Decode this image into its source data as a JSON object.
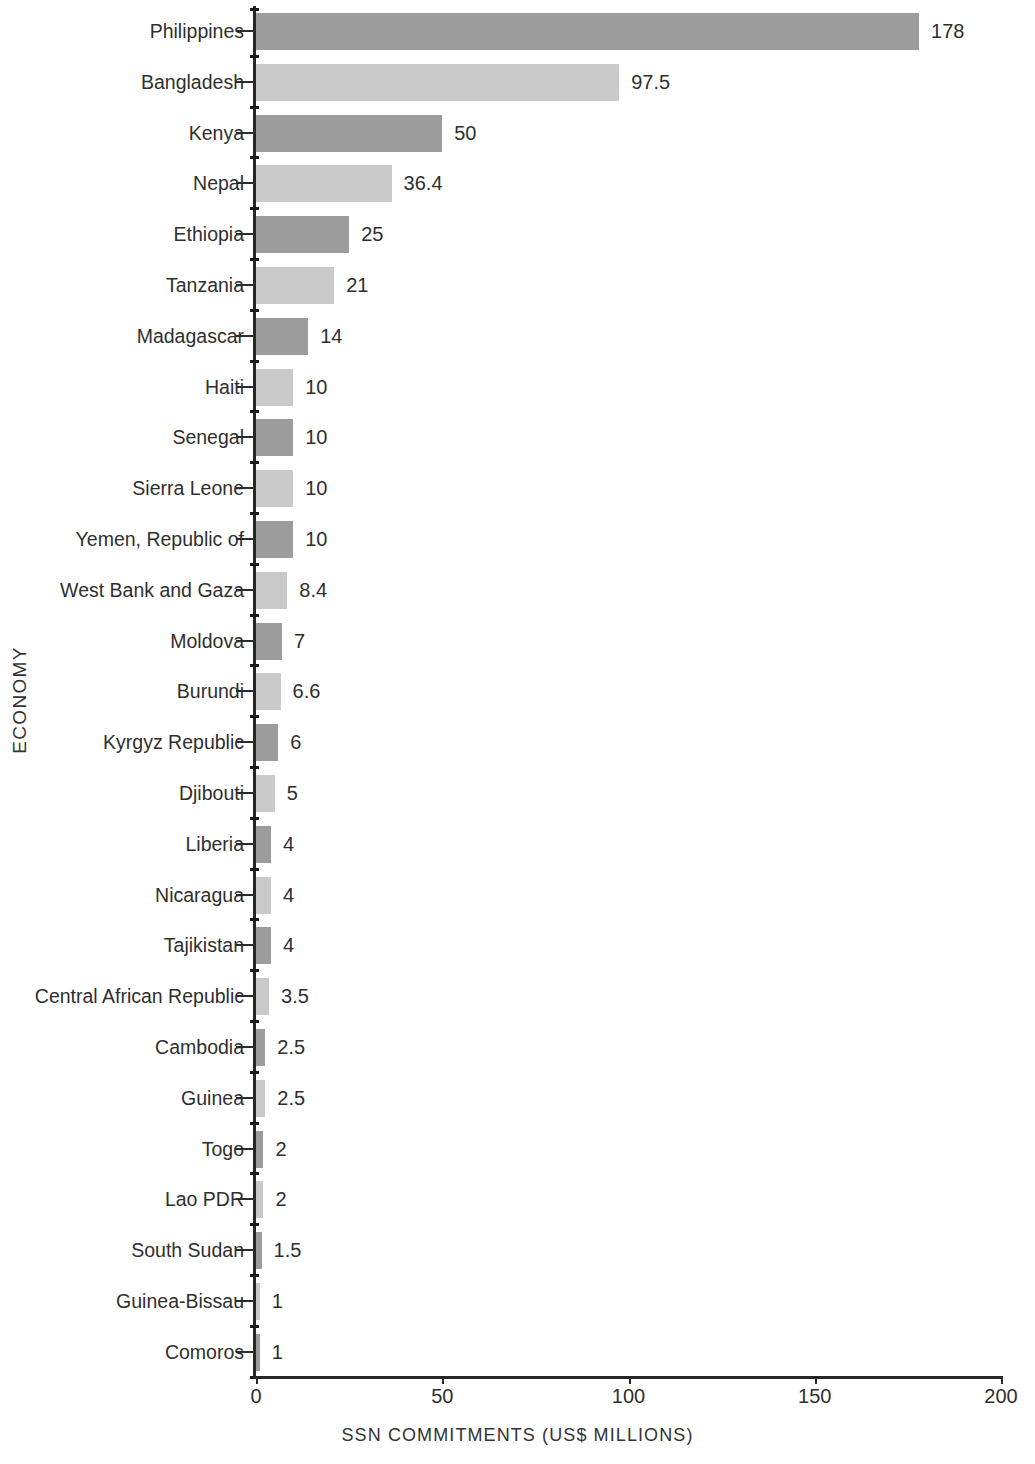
{
  "chart_data": {
    "type": "bar",
    "orientation": "horizontal",
    "title": "",
    "xlabel": "SSN COMMITMENTS (US$ MILLIONS)",
    "ylabel": "ECONOMY",
    "xlim": [
      0,
      200
    ],
    "xticks": [
      0,
      50,
      100,
      150,
      200
    ],
    "xtick_labels": [
      "0",
      "50",
      "100",
      "150",
      "200"
    ],
    "grid": false,
    "legend": null,
    "bar_colors": {
      "dark": "#9c9c9c",
      "light": "#c9c9c9"
    },
    "categories": [
      "Philippines",
      "Bangladesh",
      "Kenya",
      "Nepal",
      "Ethiopia",
      "Tanzania",
      "Madagascar",
      "Haiti",
      "Senegal",
      "Sierra Leone",
      "Yemen, Republic of",
      "West Bank and Gaza",
      "Moldova",
      "Burundi",
      "Kyrgyz Republic",
      "Djibouti",
      "Liberia",
      "Nicaragua",
      "Tajikistan",
      "Central African Republic",
      "Cambodia",
      "Guinea",
      "Togo",
      "Lao PDR",
      "South Sudan",
      "Guinea-Bissau",
      "Comoros"
    ],
    "values": [
      178,
      97.5,
      50,
      36.4,
      25,
      21,
      14,
      10,
      10,
      10,
      10,
      8.4,
      7,
      6.6,
      6,
      5,
      4,
      4,
      4,
      3.5,
      2.5,
      2.5,
      2,
      2,
      1.5,
      1,
      1
    ],
    "value_labels": [
      "178",
      "97.5",
      "50",
      "36.4",
      "25",
      "21",
      "14",
      "10",
      "10",
      "10",
      "10",
      "8.4",
      "7",
      "6.6",
      "6",
      "5",
      "4",
      "4",
      "4",
      "3.5",
      "2.5",
      "2.5",
      "2",
      "2",
      "1.5",
      "1",
      "1"
    ],
    "shades": [
      "dark",
      "light",
      "dark",
      "light",
      "dark",
      "light",
      "dark",
      "light",
      "dark",
      "light",
      "dark",
      "light",
      "dark",
      "light",
      "dark",
      "light",
      "dark",
      "light",
      "dark",
      "light",
      "dark",
      "light",
      "dark",
      "light",
      "dark",
      "light",
      "dark"
    ]
  }
}
